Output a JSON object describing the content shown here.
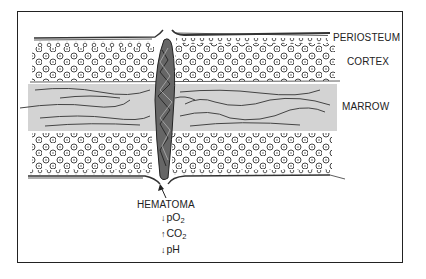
{
  "diagram": {
    "type": "anatomical-illustration",
    "colors": {
      "frame": "#222222",
      "ink": "#333333",
      "marrow_fill": "#d3d3d3",
      "hematoma": "#555555",
      "background": "#ffffff"
    },
    "layer_labels": {
      "periosteum": "PERIOSTEUM",
      "cortex": "CORTEX",
      "marrow": "MARROW"
    },
    "hematoma": {
      "label": "HEMATOMA",
      "effects": [
        {
          "direction": "down",
          "arrow": "↓",
          "species": "pO",
          "subscript": "2"
        },
        {
          "direction": "up",
          "arrow": "↑",
          "species": "CO",
          "subscript": "2"
        },
        {
          "direction": "down",
          "arrow": "↓",
          "species": "pH",
          "subscript": ""
        }
      ]
    }
  }
}
